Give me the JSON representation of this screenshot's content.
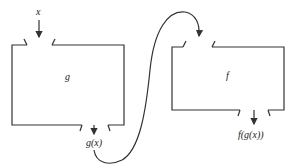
{
  "diagram": {
    "type": "function-composition",
    "boxes": [
      {
        "id": "g",
        "label": "g",
        "input_label": "x",
        "output_label": "g(x)"
      },
      {
        "id": "f",
        "label": "f",
        "input_label": "",
        "output_label": "f(g(x))"
      }
    ],
    "connector": {
      "from": "g.output",
      "to": "f.input",
      "style": "curved-arrow"
    },
    "colors": {
      "stroke": "#333333",
      "text": "#222222",
      "background": "#ffffff"
    }
  }
}
